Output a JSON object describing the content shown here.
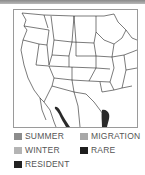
{
  "map": {
    "region": "United States and northern Mexico",
    "range_color": "#2a2a2a"
  },
  "legend": {
    "items": [
      {
        "label": "SUMMER",
        "color": "#8c8c8c"
      },
      {
        "label": "MIGRATION",
        "color": "#a8a8a8"
      },
      {
        "label": "WINTER",
        "color": "#b4b4b4"
      },
      {
        "label": "RARE",
        "color": "#1e1e1e"
      },
      {
        "label": "RESIDENT",
        "color": "#222222"
      }
    ]
  }
}
